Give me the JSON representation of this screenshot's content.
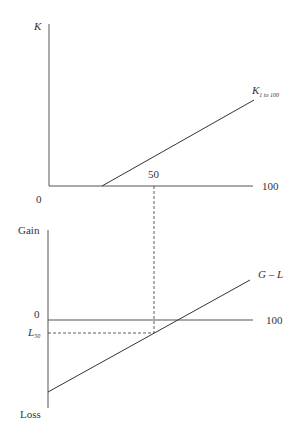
{
  "diagram": {
    "top_panel": {
      "y_axis_label": "K",
      "origin_label": "0",
      "x_tick_mid": "50",
      "x_tick_end": "100",
      "curve_label_main": "K",
      "curve_label_sub": "1 to 100"
    },
    "bottom_panel": {
      "y_axis_top_label": "Gain",
      "y_axis_bottom_label": "Loss",
      "zero_label": "0",
      "l50_label_main": "L",
      "l50_label_sub": "50",
      "x_tick_end": "100",
      "curve_label": "G – L"
    },
    "colors": {
      "line": "#333333",
      "axis": "#555555",
      "background": "#ffffff"
    }
  }
}
